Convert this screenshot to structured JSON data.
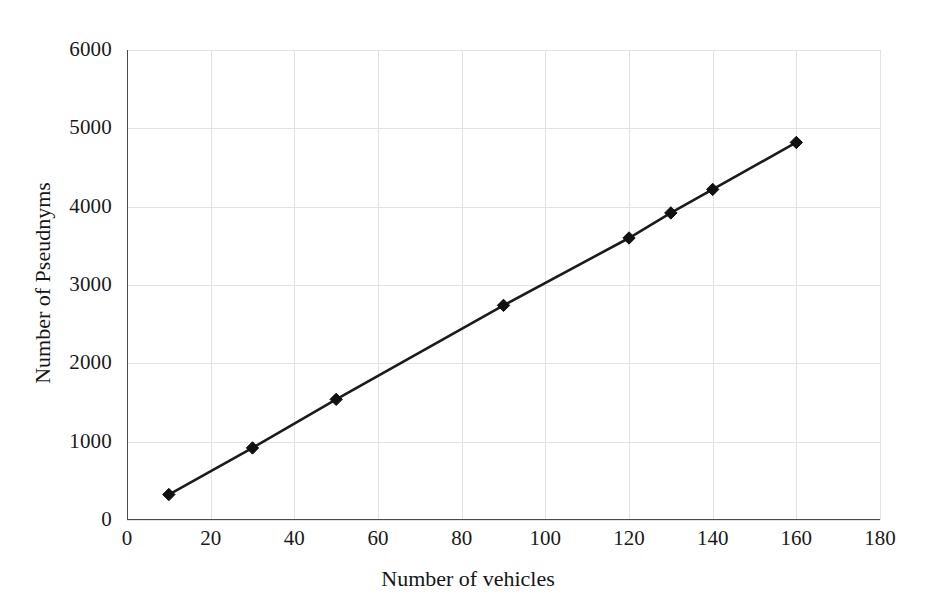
{
  "chart_data": {
    "type": "line",
    "title": "",
    "xlabel": "Number of vehicles",
    "ylabel": "Number of Pseudnyms",
    "xlim": [
      0,
      180
    ],
    "ylim": [
      0,
      6000
    ],
    "xticks": [
      0,
      20,
      40,
      60,
      80,
      100,
      120,
      140,
      160,
      180
    ],
    "yticks": [
      0,
      1000,
      2000,
      3000,
      4000,
      5000,
      6000
    ],
    "grid": true,
    "legend": "none",
    "marker": "diamond",
    "line_color": "#1b1b1b",
    "marker_color": "#111111",
    "grid_color": "#e2e2e2",
    "axis_color": "#4a4a4a",
    "series": [
      {
        "name": "Number of Pseudnyms",
        "x": [
          10,
          30,
          50,
          90,
          120,
          130,
          140,
          160
        ],
        "values": [
          325,
          920,
          1540,
          2740,
          3600,
          3920,
          4220,
          4820
        ]
      }
    ]
  }
}
